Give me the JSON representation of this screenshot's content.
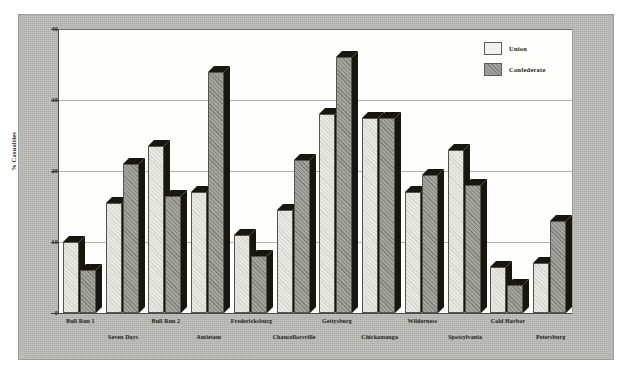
{
  "chart_data": {
    "type": "bar",
    "title": "",
    "subtitle": "",
    "xlabel": "",
    "ylabel": "% Casualties",
    "ylim": [
      0,
      40
    ],
    "yticks": [
      0,
      10,
      20,
      30,
      40
    ],
    "ytick_labels": [
      "0",
      "10",
      "20",
      "30",
      "40"
    ],
    "grid": true,
    "legend_position": "top-right",
    "categories": [
      "Bull Run 1",
      "Seven Days",
      "Bull Run 2",
      "Antietam",
      "Fredericksburg",
      "Chancellorsville",
      "Gettysburg",
      "Chickamauga",
      "Wilderness",
      "Spotsylvania",
      "Cold Harbor",
      "Petersburg"
    ],
    "series": [
      {
        "name": "Union",
        "color": "#e8e8e2",
        "values": [
          10.0,
          15.5,
          23.5,
          17.0,
          11.0,
          14.5,
          28.0,
          27.5,
          17.0,
          23.0,
          6.5,
          7.0
        ]
      },
      {
        "name": "Confederate",
        "color": "#9e9e99",
        "values": [
          6.0,
          21.0,
          16.5,
          34.0,
          8.0,
          21.5,
          36.0,
          27.5,
          19.5,
          18.0,
          4.0,
          13.0
        ]
      }
    ]
  },
  "legend": {
    "items": [
      {
        "label": "Union",
        "swatch": "union"
      },
      {
        "label": "Confederate",
        "swatch": "confederate"
      }
    ]
  },
  "axis": {
    "y_label": "% Casualties"
  }
}
